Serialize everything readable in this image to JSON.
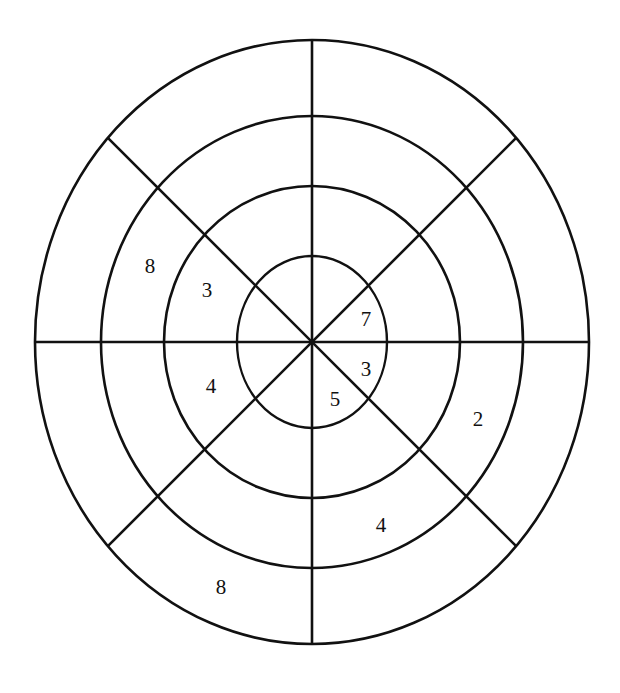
{
  "figure": {
    "background_color": "#ffffff",
    "stroke_color": "#111111",
    "text_color": "#111111"
  },
  "geometry": {
    "center_x": 312,
    "center_y": 342,
    "rings": [
      {
        "name": "ring-1-innermost",
        "rx": 75,
        "ry": 86
      },
      {
        "name": "ring-2",
        "rx": 148,
        "ry": 156
      },
      {
        "name": "ring-3",
        "rx": 211,
        "ry": 226
      },
      {
        "name": "ring-4-outermost",
        "rx": 277,
        "ry": 302
      }
    ],
    "spokes": [
      {
        "name": "spoke-vertical",
        "angle_deg": 90
      },
      {
        "name": "spoke-horizontal",
        "angle_deg": 0
      },
      {
        "name": "spoke-diagonal-nw-se",
        "angle_deg": 45
      },
      {
        "name": "spoke-diagonal-ne-sw",
        "angle_deg": 135
      }
    ],
    "sector_count": 8
  },
  "chart_data": {
    "type": "pie",
    "xlabel": "",
    "ylabel": "",
    "rings": 4,
    "sectors": 8,
    "labels": [
      {
        "id": "label-8-upper-left",
        "value": "8",
        "ring": 3,
        "sector": "upper-left",
        "x": 150,
        "y": 268
      },
      {
        "id": "label-3-upper-left",
        "value": "3",
        "ring": 2,
        "sector": "upper-left",
        "x": 207,
        "y": 292
      },
      {
        "id": "label-7-inner-right",
        "value": "7",
        "ring": 1,
        "sector": "inner-upper-right",
        "x": 366,
        "y": 321
      },
      {
        "id": "label-4-left",
        "value": "4",
        "ring": 2,
        "sector": "lower-left",
        "x": 211,
        "y": 388
      },
      {
        "id": "label-3-inner-right",
        "value": "3",
        "ring": 1,
        "sector": "inner-lower-right",
        "x": 366,
        "y": 371
      },
      {
        "id": "label-5-inner-bottom",
        "value": "5",
        "ring": 1,
        "sector": "inner-bottom",
        "x": 335,
        "y": 401
      },
      {
        "id": "label-2-right",
        "value": "2",
        "ring": 4,
        "sector": "lower-right",
        "x": 478,
        "y": 421
      },
      {
        "id": "label-4-lower-right",
        "value": "4",
        "ring": 3,
        "sector": "lower-right",
        "x": 381,
        "y": 527
      },
      {
        "id": "label-8-bottom",
        "value": "8",
        "ring": 4,
        "sector": "bottom-left",
        "x": 221,
        "y": 589
      }
    ],
    "values": [
      8,
      3,
      7,
      4,
      3,
      5,
      2,
      4,
      8
    ],
    "grid": true,
    "legend": "none"
  }
}
